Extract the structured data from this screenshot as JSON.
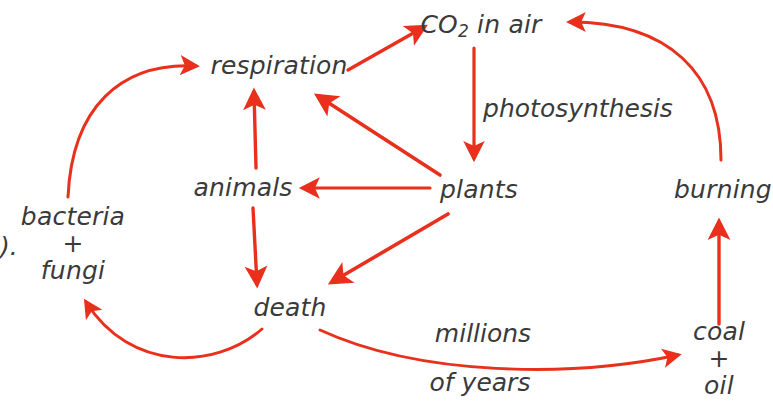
{
  "diagram": {
    "accent_color": "#e8301c",
    "text_color": "#3a3a3a",
    "background_color": "#ffffff",
    "edge_marker_text": ").",
    "nodes": [
      {
        "id": "co2",
        "label_main": "CO",
        "label_sub": "2",
        "label_tail": " in air",
        "x": 481,
        "y": 26
      },
      {
        "id": "respiration",
        "label": "respiration",
        "x": 279,
        "y": 66
      },
      {
        "id": "animals",
        "label": "animals",
        "x": 243,
        "y": 188
      },
      {
        "id": "plants",
        "label": "plants",
        "x": 479,
        "y": 190
      },
      {
        "id": "burning",
        "label": "burning",
        "x": 723,
        "y": 190
      },
      {
        "id": "death",
        "label": "death",
        "x": 290,
        "y": 308
      },
      {
        "id": "bacteria_fungi",
        "line1": "bacteria",
        "line2": "+",
        "line3": "fungi",
        "x": 73,
        "y": 243
      },
      {
        "id": "coal_oil",
        "line1": "coal",
        "line2": "+",
        "line3": "oil",
        "x": 719,
        "y": 358
      }
    ],
    "edge_labels": [
      {
        "id": "photosynthesis",
        "text": "photosynthesis",
        "x": 578,
        "y": 108
      },
      {
        "id": "millions",
        "text": "millions",
        "x": 483,
        "y": 333
      },
      {
        "id": "of_years",
        "text": "of years",
        "x": 480,
        "y": 382
      }
    ],
    "arrows": [
      {
        "id": "respiration-to-co2",
        "from": "respiration",
        "to": "co2"
      },
      {
        "id": "co2-to-plants",
        "from": "co2",
        "to": "plants",
        "label": "photosynthesis"
      },
      {
        "id": "plants-to-respiration",
        "from": "plants",
        "to": "respiration"
      },
      {
        "id": "plants-to-animals",
        "from": "plants",
        "to": "animals"
      },
      {
        "id": "plants-to-death",
        "from": "plants",
        "to": "death"
      },
      {
        "id": "animals-to-respiration",
        "from": "animals",
        "to": "respiration"
      },
      {
        "id": "animals-to-death",
        "from": "animals",
        "to": "death"
      },
      {
        "id": "death-to-bacteria-fungi",
        "from": "death",
        "to": "bacteria_fungi"
      },
      {
        "id": "bacteria-fungi-to-respiration",
        "from": "bacteria_fungi",
        "to": "respiration"
      },
      {
        "id": "death-to-coal-oil",
        "from": "death",
        "to": "coal_oil",
        "label": "millions of years"
      },
      {
        "id": "coal-oil-to-burning",
        "from": "coal_oil",
        "to": "burning"
      },
      {
        "id": "burning-to-co2",
        "from": "burning",
        "to": "co2"
      }
    ]
  }
}
